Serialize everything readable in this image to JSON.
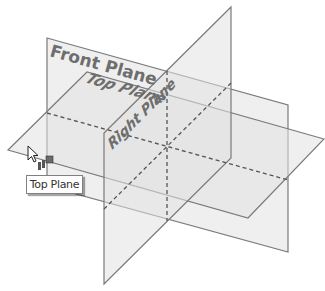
{
  "diagram": {
    "planes": [
      {
        "name": "Front Plane",
        "label": "Front Plane"
      },
      {
        "name": "Top Plane",
        "label": "Top Plane"
      },
      {
        "name": "Right Plane",
        "label": "Right Plane"
      }
    ]
  },
  "labels": {
    "front": "Front Plane",
    "top": "Top Plane",
    "right": "Right Plane"
  },
  "tooltip": {
    "text": "Top Plane"
  },
  "cursor": {
    "icon": "arrow-cursor-with-plane-icon"
  },
  "colors": {
    "plane_fill": "#e1e1e1",
    "plane_edge": "#7a7a7a",
    "label": "#6e6e6e"
  }
}
